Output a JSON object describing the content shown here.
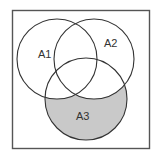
{
  "diagram": {
    "type": "venn",
    "universe": {
      "x": 12,
      "y": 10,
      "width": 137,
      "height": 138,
      "stroke": "#555555"
    },
    "sets": [
      {
        "label": "A1",
        "cx": 57,
        "cy": 59,
        "r": 40,
        "label_x": 41,
        "label_y": 55
      },
      {
        "label": "A2",
        "cx": 94,
        "cy": 59,
        "r": 40,
        "label_x": 106,
        "label_y": 45
      },
      {
        "label": "A3",
        "cx": 86,
        "cy": 99,
        "r": 41,
        "label_x": 76,
        "label_y": 119
      }
    ],
    "shaded_region": {
      "description": "A3 minus (A1 union A2)",
      "fill": "#c9c9c9"
    },
    "stroke_color": "#333333"
  }
}
